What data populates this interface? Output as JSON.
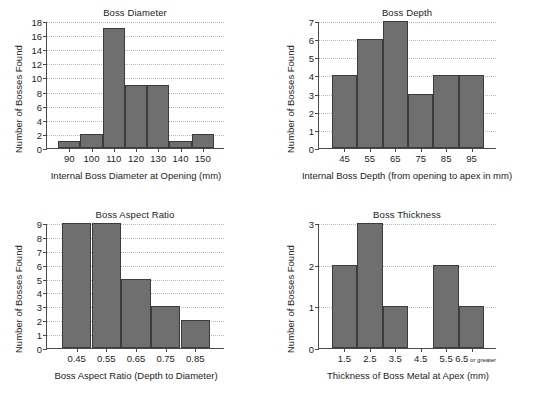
{
  "figure": {
    "background": "#ffffff",
    "bar_fill": "#6f6f6f",
    "bar_edge": "#3c3c3c",
    "axis_color": "#4a4a4a",
    "grid_color": "#b9b9b9",
    "shared_ylabel": "Number of Bosses Found"
  },
  "chart_data": [
    {
      "id": "boss-diameter",
      "type": "bar",
      "title": "Boss Diameter",
      "xlabel": "Internal Boss Diameter at Opening (mm)",
      "ylabel": "Number of Bosses Found",
      "categories": [
        "90",
        "100",
        "110",
        "120",
        "130",
        "140",
        "150"
      ],
      "values": [
        1,
        2,
        17,
        9,
        9,
        1,
        2
      ],
      "ylim": [
        0,
        18
      ],
      "yticks": [
        0,
        2,
        4,
        6,
        8,
        10,
        12,
        14,
        16,
        18
      ],
      "ytick_labels": [
        "0",
        "2",
        "4",
        "6",
        "8",
        "10",
        "12",
        "14",
        "16",
        "18"
      ],
      "grid": true,
      "legend": "none"
    },
    {
      "id": "boss-depth",
      "type": "bar",
      "title": "Boss Depth",
      "xlabel": "Internal Boss Depth (from opening to apex in mm)",
      "ylabel": "Number of Bosses Found",
      "categories": [
        "45",
        "55",
        "65",
        "75",
        "85",
        "95"
      ],
      "values": [
        4,
        6,
        7,
        3,
        4,
        4
      ],
      "ylim": [
        0,
        7
      ],
      "yticks": [
        0,
        1,
        2,
        3,
        4,
        5,
        6,
        7
      ],
      "ytick_labels": [
        "0",
        "1",
        "2",
        "3",
        "4",
        "5",
        "6",
        "7"
      ],
      "grid": true,
      "legend": "none"
    },
    {
      "id": "boss-aspect-ratio",
      "type": "bar",
      "title": "Boss Aspect Ratio",
      "xlabel": "Boss Aspect Ratio (Depth to Diameter)",
      "ylabel": "Number of Bosses Found",
      "categories": [
        "0.45",
        "0.55",
        "0.65",
        "0.75",
        "0.85"
      ],
      "values": [
        9,
        9,
        5,
        3,
        2
      ],
      "ylim": [
        0,
        9
      ],
      "yticks": [
        0,
        1,
        2,
        3,
        4,
        5,
        6,
        7,
        8,
        9
      ],
      "ytick_labels": [
        "0",
        "1",
        "2",
        "3",
        "4",
        "5",
        "6",
        "7",
        "8",
        "9"
      ],
      "grid": true,
      "legend": "none"
    },
    {
      "id": "boss-thickness",
      "type": "bar",
      "title": "Boss Thickness",
      "xlabel": "Thickness of Boss Metal at Apex (mm)",
      "ylabel": "Number of Bosses Found",
      "categories": [
        "1.5",
        "2.5",
        "3.5",
        "4.5",
        "5.5",
        "6.5"
      ],
      "category_suffixes": [
        "",
        "",
        "",
        "",
        "",
        "or greater"
      ],
      "values": [
        2,
        3,
        1,
        0,
        2,
        1
      ],
      "ylim": [
        0,
        3
      ],
      "yticks": [
        0,
        1,
        2,
        3
      ],
      "ytick_labels": [
        "0",
        "1",
        "2",
        "3"
      ],
      "grid": true,
      "legend": "none"
    }
  ],
  "panels": [
    {
      "plot": {
        "left": 46,
        "top": 22,
        "width": 178,
        "height": 127
      },
      "title": {
        "left": 46,
        "top": 7,
        "width": 178
      },
      "xlabel": {
        "left": 16,
        "top": 170,
        "width": 240
      },
      "ylabel": {
        "left": 13,
        "top": 153
      }
    },
    {
      "plot": {
        "left": 46,
        "top": 22,
        "width": 178,
        "height": 127
      },
      "title": {
        "left": 46,
        "top": 7,
        "width": 178
      },
      "xlabel": {
        "left": 2,
        "top": 170,
        "width": 266
      },
      "ylabel": {
        "left": 13,
        "top": 153
      }
    },
    {
      "plot": {
        "left": 46,
        "top": 22,
        "width": 178,
        "height": 125
      },
      "title": {
        "left": 46,
        "top": 7,
        "width": 178
      },
      "xlabel": {
        "left": 14,
        "top": 168,
        "width": 244
      },
      "ylabel": {
        "left": 13,
        "top": 151
      }
    },
    {
      "plot": {
        "left": 46,
        "top": 22,
        "width": 178,
        "height": 125
      },
      "title": {
        "left": 46,
        "top": 7,
        "width": 178
      },
      "xlabel": {
        "left": 14,
        "top": 168,
        "width": 244
      },
      "ylabel": {
        "left": 13,
        "top": 151
      }
    }
  ]
}
